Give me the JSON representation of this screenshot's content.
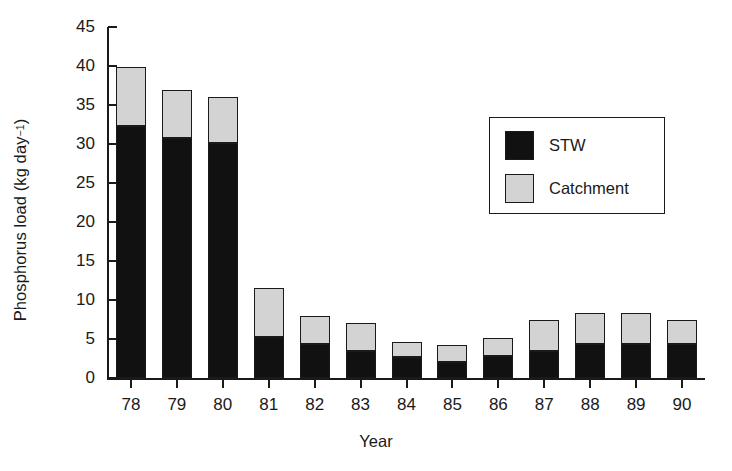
{
  "chart_data": {
    "type": "bar",
    "title": "",
    "subtitle": "",
    "stacked": true,
    "xlabel": "Year",
    "ylabel": "Phosphorus load (kg day",
    "ylabel_exponent": "−1",
    "ylabel_suffix": ")",
    "categories": [
      "78",
      "79",
      "80",
      "81",
      "82",
      "83",
      "84",
      "85",
      "86",
      "87",
      "88",
      "89",
      "90"
    ],
    "series": [
      {
        "name": "STW",
        "color": "#111111",
        "values": [
          32.3,
          30.8,
          30.1,
          5.2,
          4.3,
          3.4,
          2.7,
          2.0,
          2.8,
          3.5,
          4.3,
          4.3,
          4.3
        ]
      },
      {
        "name": "Catchment",
        "color": "#d3d3d3",
        "values": [
          7.6,
          6.1,
          5.9,
          6.4,
          3.7,
          3.6,
          1.9,
          2.2,
          2.3,
          4.0,
          4.1,
          4.1,
          3.2
        ]
      }
    ],
    "totals": [
      39.9,
      36.9,
      36.0,
      11.6,
      8.0,
      7.0,
      4.6,
      4.2,
      5.1,
      7.5,
      8.4,
      8.4,
      7.5
    ],
    "ylim": [
      0,
      45
    ],
    "yticks": [
      "0",
      "5",
      "10",
      "15",
      "20",
      "25",
      "30",
      "35",
      "40",
      "45"
    ],
    "ytick_values": [
      0,
      5,
      10,
      15,
      20,
      25,
      30,
      35,
      40,
      45
    ],
    "grid": false,
    "legend": {
      "position": "upper-right-inside",
      "entries": [
        {
          "label": "STW",
          "color": "#111111"
        },
        {
          "label": "Catchment",
          "color": "#d3d3d3"
        }
      ]
    }
  }
}
